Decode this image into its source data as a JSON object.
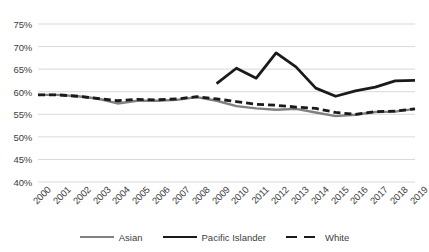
{
  "chart_data": {
    "type": "line",
    "title": "",
    "subtitle": "",
    "xlabel": "",
    "ylabel": "",
    "grid": true,
    "legend_position": "bottom",
    "ylim": [
      40,
      75
    ],
    "ytick_step": 5,
    "ytick_labels": [
      "75%",
      "70%",
      "65%",
      "60%",
      "55%",
      "50%",
      "45%",
      "40%"
    ],
    "ytick_values": [
      75,
      70,
      65,
      60,
      55,
      50,
      45,
      40
    ],
    "categories": [
      "2000",
      "2001",
      "2002",
      "2003",
      "2004",
      "2005",
      "2006",
      "2007",
      "2008",
      "2009",
      "2010",
      "2011",
      "2012",
      "2013",
      "2014",
      "2015",
      "2016",
      "2017",
      "2018",
      "2019"
    ],
    "x": [
      2000,
      2001,
      2002,
      2003,
      2004,
      2005,
      2006,
      2007,
      2008,
      2009,
      2010,
      2011,
      2012,
      2013,
      2014,
      2015,
      2016,
      2017,
      2018,
      2019
    ],
    "series": [
      {
        "name": "Asian",
        "color": "#808080",
        "style": "solid",
        "width": 2.4,
        "values": [
          59.3,
          59.3,
          59.0,
          58.5,
          57.4,
          58.0,
          58.0,
          58.2,
          58.8,
          58.0,
          56.8,
          56.3,
          56.0,
          56.2,
          55.4,
          54.6,
          54.9,
          55.5,
          55.6,
          56.2
        ]
      },
      {
        "name": "Pacific Islander",
        "color": "#1a1a1a",
        "style": "solid",
        "width": 2.8,
        "values": [
          null,
          null,
          null,
          null,
          null,
          null,
          null,
          null,
          null,
          61.8,
          65.2,
          63.0,
          68.6,
          65.5,
          60.8,
          59.0,
          60.2,
          61.0,
          62.4,
          62.5
        ]
      },
      {
        "name": "White",
        "color": "#1a1a1a",
        "style": "dashed",
        "width": 2.8,
        "values": [
          59.3,
          59.3,
          59.0,
          58.5,
          58.0,
          58.3,
          58.2,
          58.4,
          58.9,
          58.4,
          57.8,
          57.2,
          57.0,
          56.6,
          56.3,
          55.4,
          55.0,
          55.6,
          55.7,
          56.2
        ]
      }
    ],
    "colors": {
      "grid": "#d9d9d9",
      "axis_text": "#404040",
      "asian": "#808080",
      "pacific_islander": "#1a1a1a",
      "white_series": "#1a1a1a",
      "background": "#ffffff"
    }
  }
}
